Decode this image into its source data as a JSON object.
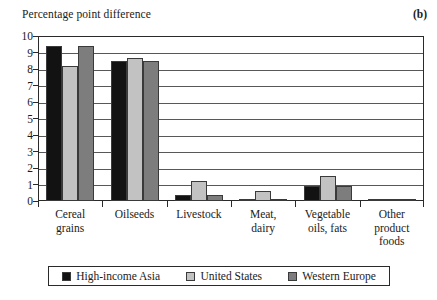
{
  "panel": {
    "axis_title": "Percentage point difference",
    "label": "(b)"
  },
  "legend": {
    "items": [
      {
        "label": "High-income Asia",
        "color": "#121212"
      },
      {
        "label": "United States",
        "color": "#c2c2c2"
      },
      {
        "label": "Western Europe",
        "color": "#7d7d7d"
      }
    ]
  },
  "yaxis": {
    "ticks": [
      "0",
      "1",
      "2",
      "3",
      "4",
      "5",
      "6",
      "7",
      "8",
      "9",
      "10"
    ]
  },
  "categories_display": [
    [
      "Cereal",
      "grains"
    ],
    [
      "Oilseeds"
    ],
    [
      "Livestock"
    ],
    [
      "Meat,",
      "dairy"
    ],
    [
      "Vegetable",
      "oils, fats"
    ],
    [
      "Other",
      "product",
      "foods"
    ]
  ],
  "chart_data": {
    "type": "bar",
    "title": "",
    "xlabel": "",
    "ylabel": "Percentage point difference",
    "ylim": [
      0,
      10
    ],
    "ytick_step": 1,
    "grid": true,
    "legend_position": "bottom",
    "categories": [
      "Cereal grains",
      "Oilseeds",
      "Livestock",
      "Meat, dairy",
      "Vegetable oils, fats",
      "Other product foods"
    ],
    "series": [
      {
        "name": "High-income Asia",
        "color": "#121212",
        "values": [
          9.4,
          8.5,
          0.35,
          0.1,
          0.9,
          0.07
        ]
      },
      {
        "name": "United States",
        "color": "#c2c2c2",
        "values": [
          8.2,
          8.65,
          1.2,
          0.62,
          1.5,
          0.06
        ]
      },
      {
        "name": "Western Europe",
        "color": "#7d7d7d",
        "values": [
          9.4,
          8.5,
          0.35,
          0.1,
          0.88,
          0.05
        ]
      }
    ]
  }
}
